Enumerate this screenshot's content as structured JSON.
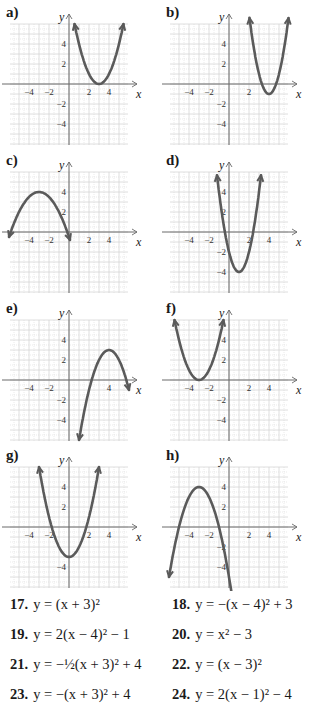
{
  "chart_data": [
    {
      "type": "line",
      "label": "a)",
      "title": "a)",
      "xlabel": "x",
      "ylabel": "y",
      "xlim": [
        -6,
        6
      ],
      "ylim": [
        -6,
        6
      ],
      "x_ticks": [
        -4,
        -2,
        2,
        4
      ],
      "y_ticks": [
        4,
        2,
        -2,
        -4
      ],
      "grid": true,
      "series": [
        {
          "name": "parabola",
          "a": 1,
          "h": 3,
          "k": 0,
          "vertex": [
            3,
            0
          ],
          "x_range": [
            0.55,
            5.45
          ]
        }
      ]
    },
    {
      "type": "line",
      "label": "b)",
      "title": "b)",
      "xlabel": "x",
      "ylabel": "y",
      "xlim": [
        -6,
        6
      ],
      "ylim": [
        -6,
        6
      ],
      "x_ticks": [
        -4,
        -2,
        2
      ],
      "y_ticks": [
        4,
        2,
        -2,
        -4
      ],
      "grid": true,
      "series": [
        {
          "name": "parabola",
          "a": 2,
          "h": 4,
          "k": -1,
          "vertex": [
            4,
            -1
          ],
          "x_range": [
            2.05,
            5.95
          ]
        }
      ]
    },
    {
      "type": "line",
      "label": "c)",
      "title": "c)",
      "xlabel": "x",
      "ylabel": "y",
      "xlim": [
        -6,
        6
      ],
      "ylim": [
        -6,
        6
      ],
      "x_ticks": [
        -4,
        -2,
        2,
        4
      ],
      "y_ticks": [
        4,
        2
      ],
      "grid": true,
      "series": [
        {
          "name": "parabola",
          "a": -0.5,
          "h": -3,
          "k": 4,
          "vertex": [
            -3,
            4
          ],
          "x_range": [
            -6,
            0.1
          ]
        }
      ]
    },
    {
      "type": "line",
      "label": "d)",
      "title": "d)",
      "xlabel": "x",
      "ylabel": "y",
      "xlim": [
        -6,
        6
      ],
      "ylim": [
        -6,
        6
      ],
      "x_ticks": [
        -4,
        -2,
        2,
        4
      ],
      "y_ticks": [
        4,
        2,
        -2,
        -4
      ],
      "grid": true,
      "series": [
        {
          "name": "parabola",
          "a": 2,
          "h": 1,
          "k": -4,
          "vertex": [
            1,
            -4
          ],
          "x_range": [
            -1.2,
            3.2
          ]
        }
      ]
    },
    {
      "type": "line",
      "label": "e)",
      "title": "e)",
      "xlabel": "x",
      "ylabel": "y",
      "xlim": [
        -6,
        6
      ],
      "ylim": [
        -6,
        6
      ],
      "x_ticks": [
        -4,
        -2,
        4
      ],
      "y_ticks": [
        4,
        2,
        -2,
        -4
      ],
      "grid": true,
      "series": [
        {
          "name": "parabola",
          "a": -1,
          "h": 4,
          "k": 3,
          "vertex": [
            4,
            3
          ],
          "x_range": [
            1,
            6
          ]
        }
      ]
    },
    {
      "type": "line",
      "label": "f)",
      "title": "f)",
      "xlabel": "x",
      "ylabel": "y",
      "xlim": [
        -6,
        6
      ],
      "ylim": [
        -6,
        6
      ],
      "x_ticks": [
        -4,
        -2,
        2,
        4
      ],
      "y_ticks": [
        4,
        2,
        -2,
        -4
      ],
      "grid": true,
      "series": [
        {
          "name": "parabola",
          "a": 1,
          "h": -3,
          "k": 0,
          "vertex": [
            -3,
            0
          ],
          "x_range": [
            -5.45,
            -0.55
          ]
        }
      ]
    },
    {
      "type": "line",
      "label": "g)",
      "title": "g)",
      "xlabel": "x",
      "ylabel": "y",
      "xlim": [
        -6,
        6
      ],
      "ylim": [
        -6,
        6
      ],
      "x_ticks": [
        -4,
        -2,
        2,
        4
      ],
      "y_ticks": [
        4,
        2,
        -4
      ],
      "grid": true,
      "series": [
        {
          "name": "parabola",
          "a": 1,
          "h": 0,
          "k": -3,
          "vertex": [
            0,
            -3
          ],
          "x_range": [
            -3,
            3
          ]
        }
      ]
    },
    {
      "type": "line",
      "label": "h)",
      "title": "h)",
      "xlabel": "x",
      "ylabel": "y",
      "xlim": [
        -6,
        6
      ],
      "ylim": [
        -6,
        6
      ],
      "x_ticks": [
        -4,
        -2,
        2,
        4
      ],
      "y_ticks": [
        4,
        2,
        -2,
        -4
      ],
      "grid": true,
      "series": [
        {
          "name": "parabola",
          "a": -1,
          "h": -3,
          "k": 4,
          "vertex": [
            -3,
            4
          ],
          "x_range": [
            -6,
            1.45
          ]
        }
      ]
    }
  ],
  "colors": {
    "curve": "#5a5a5a",
    "axis": "#6b6b6b",
    "grid": "#d6d6d6",
    "text": "#1a1a1a"
  },
  "axis_labels": {
    "x": "x",
    "y": "y"
  },
  "equations": [
    {
      "number": "17.",
      "text": "y = (x + 3)²"
    },
    {
      "number": "18.",
      "text": "y = −(x − 4)² + 3"
    },
    {
      "number": "19.",
      "text": "y = 2(x − 4)² − 1"
    },
    {
      "number": "20.",
      "text": "y = x² − 3"
    },
    {
      "number": "21.",
      "text": "y = −½(x + 3)² + 4"
    },
    {
      "number": "22.",
      "text": "y = (x − 3)²"
    },
    {
      "number": "23.",
      "text": "y = −(x + 3)² + 4"
    },
    {
      "number": "24.",
      "text": "y = 2(x − 1)² − 4"
    }
  ]
}
